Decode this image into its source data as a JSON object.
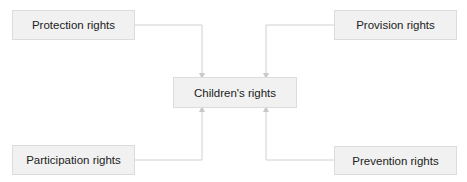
{
  "diagram": {
    "center": {
      "label": "Children's rights"
    },
    "nodes": [
      {
        "id": "protection",
        "label": "Protection rights",
        "position": "top-left"
      },
      {
        "id": "provision",
        "label": "Provision rights",
        "position": "top-right"
      },
      {
        "id": "participation",
        "label": "Participation rights",
        "position": "bottom-left"
      },
      {
        "id": "prevention",
        "label": "Prevention rights",
        "position": "bottom-right"
      }
    ],
    "edges": [
      {
        "from": "protection",
        "to": "center"
      },
      {
        "from": "provision",
        "to": "center"
      },
      {
        "from": "participation",
        "to": "center"
      },
      {
        "from": "prevention",
        "to": "center"
      }
    ],
    "colors": {
      "node_fill": "#f1f1f1",
      "node_border": "#dcdcdc",
      "connector": "#cfcfcf"
    }
  }
}
